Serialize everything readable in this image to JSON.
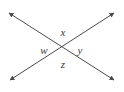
{
  "figure": {
    "canvas": {
      "width": 124,
      "height": 92,
      "background": "#ffffff"
    },
    "stroke_color": "#4a4a4a",
    "stroke_width": 1,
    "intersection": {
      "x": 62,
      "y": 46
    },
    "lines": [
      {
        "name": "line-nw-se",
        "from": {
          "x": 9,
          "y": 13
        },
        "to": {
          "x": 114,
          "y": 80
        },
        "arrow_start": true,
        "arrow_end": true
      },
      {
        "name": "line-sw-ne",
        "from": {
          "x": 10,
          "y": 80
        },
        "to": {
          "x": 114,
          "y": 13
        },
        "arrow_start": true,
        "arrow_end": true
      }
    ],
    "labels": [
      {
        "name": "angle-label-x",
        "text": "x",
        "position": "top",
        "x": 63,
        "y": 32
      },
      {
        "name": "angle-label-w",
        "text": "w",
        "position": "left",
        "x": 44,
        "y": 50
      },
      {
        "name": "angle-label-y",
        "text": "y",
        "position": "right",
        "x": 80,
        "y": 50
      },
      {
        "name": "angle-label-z",
        "text": "z",
        "position": "bottom",
        "x": 63,
        "y": 64
      }
    ]
  }
}
